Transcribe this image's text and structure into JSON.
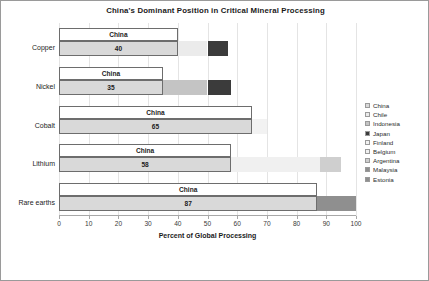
{
  "chart_data": {
    "type": "bar",
    "orientation": "horizontal",
    "stacked": true,
    "title": "China's Dominant Position in Critical Mineral Processing",
    "xlabel": "Percent of Global Processing",
    "ylabel": "",
    "xlim": [
      0,
      100
    ],
    "xticks": [
      0,
      10,
      20,
      30,
      40,
      50,
      60,
      70,
      80,
      90,
      100
    ],
    "grid": "vertical",
    "legend_position": "right",
    "categories": [
      "Copper",
      "Nickel",
      "Cobalt",
      "Lithium",
      "Rare earths"
    ],
    "series": [
      {
        "name": "China",
        "values": [
          40,
          35,
          65,
          58,
          87
        ],
        "color": "#d9d9d9"
      },
      {
        "name": "Chile",
        "values": [
          10,
          0,
          0,
          0,
          0
        ],
        "color": "#ebebeb"
      },
      {
        "name": "Indonesia",
        "values": [
          0,
          15,
          0,
          0,
          0
        ],
        "color": "#c4c4c4"
      },
      {
        "name": "Japan",
        "values": [
          7,
          8,
          0,
          0,
          0
        ],
        "color": "#3b3b3b"
      },
      {
        "name": "Finland",
        "values": [
          0,
          0,
          5,
          0,
          0
        ],
        "color": "#f2f2f2"
      },
      {
        "name": "Belgium",
        "values": [
          0,
          0,
          0,
          30,
          0
        ],
        "color": "#f0f0f0"
      },
      {
        "name": "Argentina",
        "values": [
          0,
          0,
          0,
          7,
          0
        ],
        "color": "#cfcfcf"
      },
      {
        "name": "Malaysia",
        "values": [
          0,
          0,
          0,
          0,
          9
        ],
        "color": "#8f8f8f"
      },
      {
        "name": "Estonia",
        "values": [
          0,
          0,
          0,
          0,
          4
        ],
        "color": "#8f8f8f"
      }
    ],
    "data_labels": [
      {
        "category": "Copper",
        "series": "China",
        "label": "China",
        "value": "40"
      },
      {
        "category": "Nickel",
        "series": "China",
        "label": "China",
        "value": "35"
      },
      {
        "category": "Cobalt",
        "series": "China",
        "label": "China",
        "value": "65"
      },
      {
        "category": "Lithium",
        "series": "China",
        "label": "China",
        "value": "58"
      },
      {
        "category": "Rare earths",
        "series": "China",
        "label": "China",
        "value": "87"
      }
    ]
  },
  "legend": {
    "items": [
      {
        "label": "China",
        "swatch": "legend-swatch-china"
      },
      {
        "label": "Chile",
        "swatch": "legend-swatch-chile"
      },
      {
        "label": "Indonesia",
        "swatch": "legend-swatch-indonesia"
      },
      {
        "label": "Japan",
        "swatch": "legend-swatch-japan"
      },
      {
        "label": "Finland",
        "swatch": "legend-swatch-finland"
      },
      {
        "label": "Belgium",
        "swatch": "legend-swatch-belgium"
      },
      {
        "label": "Argentina",
        "swatch": "legend-swatch-argentina"
      },
      {
        "label": "Malaysia",
        "swatch": "legend-swatch-malaysia"
      },
      {
        "label": "Estonia",
        "swatch": "legend-swatch-estonia"
      }
    ]
  },
  "colors": {
    "china": "#d9d9d9",
    "chile": "#ebebeb",
    "indonesia": "#c4c4c4",
    "japan": "#3b3b3b",
    "finland": "#f2f2f2",
    "belgium": "#f0f0f0",
    "argentina": "#cfcfcf",
    "malaysia": "#8f8f8f",
    "estonia": "#8f8f8f",
    "grid": "#e4e4e4",
    "axis": "#a8a8a8",
    "text": "#1c1c1c"
  }
}
